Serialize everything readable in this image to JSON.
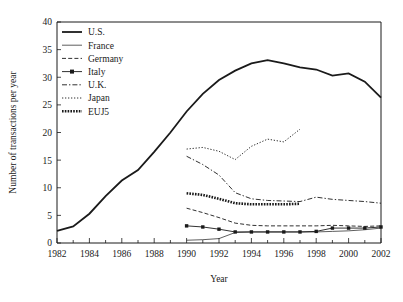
{
  "chart_data": {
    "type": "line",
    "title": "",
    "xlabel": "Year",
    "ylabel": "Number of transactions per year",
    "xlim": [
      1982,
      2002
    ],
    "ylim": [
      0,
      40
    ],
    "xticks": [
      1982,
      1984,
      1986,
      1988,
      1990,
      1992,
      1994,
      1996,
      1998,
      2000,
      2002
    ],
    "xtick_labels": [
      "1982",
      "1984",
      "1986",
      "1988",
      "1990",
      "1992",
      "1994",
      "1996",
      "1998",
      "2000",
      "2002"
    ],
    "xminor_ticks": [
      1983,
      1985,
      1987,
      1989,
      1991,
      1993,
      1995,
      1997,
      1999,
      2001
    ],
    "yticks": [
      0,
      5,
      10,
      15,
      20,
      25,
      30,
      35,
      40
    ],
    "ytick_labels": [
      "0",
      "5",
      "10",
      "15",
      "20",
      "25",
      "30",
      "35",
      "40"
    ],
    "grid": false,
    "legend_position": "top-left",
    "series": [
      {
        "name": "U.S.",
        "style": "solid-thick",
        "markers": "none",
        "x": [
          1982,
          1983,
          1984,
          1985,
          1986,
          1987,
          1988,
          1989,
          1990,
          1991,
          1992,
          1993,
          1994,
          1995,
          1996,
          1997,
          1998,
          1999,
          2000,
          2001,
          2002
        ],
        "values": [
          2.2,
          3.0,
          5.3,
          8.5,
          11.3,
          13.2,
          16.5,
          20.0,
          23.8,
          27.0,
          29.5,
          31.2,
          32.5,
          33.1,
          32.5,
          31.8,
          31.4,
          30.3,
          30.7,
          29.2,
          26.3
        ]
      },
      {
        "name": "France",
        "style": "solid-thin",
        "markers": "none",
        "x": [
          1990,
          1991,
          1992,
          1993,
          1994,
          1995,
          1996,
          1997,
          1998,
          1999,
          2000,
          2001,
          2002
        ],
        "values": [
          0.5,
          0.6,
          0.8,
          1.9,
          2.0,
          2.0,
          2.0,
          2.0,
          2.0,
          2.1,
          2.2,
          2.4,
          2.7
        ]
      },
      {
        "name": "Germany",
        "style": "dashed",
        "markers": "none",
        "x": [
          1990,
          1991,
          1992,
          1993,
          1994,
          1995,
          1996,
          1997,
          1998,
          1999,
          2000,
          2001,
          2002
        ],
        "values": [
          6.3,
          5.5,
          4.6,
          3.6,
          3.2,
          3.1,
          3.1,
          3.1,
          3.1,
          3.2,
          3.1,
          3.0,
          3.1
        ]
      },
      {
        "name": "Italy",
        "style": "solid-marker",
        "markers": "square",
        "x": [
          1990,
          1991,
          1992,
          1993,
          1994,
          1995,
          1996,
          1997,
          1998,
          1999,
          2000,
          2001,
          2002
        ],
        "values": [
          3.1,
          2.9,
          2.5,
          2.0,
          2.0,
          2.0,
          2.0,
          2.0,
          2.1,
          2.7,
          2.7,
          2.7,
          2.9
        ]
      },
      {
        "name": "U.K.",
        "style": "dash-dot",
        "markers": "none",
        "x": [
          1990,
          1991,
          1992,
          1993,
          1994,
          1995,
          1996,
          1997,
          1998,
          1999,
          2000,
          2001,
          2002
        ],
        "values": [
          15.7,
          14.2,
          12.3,
          9.1,
          8.0,
          7.7,
          7.6,
          7.5,
          8.3,
          7.9,
          7.7,
          7.5,
          7.2
        ]
      },
      {
        "name": "Japan",
        "style": "dotted",
        "markers": "none",
        "x": [
          1990,
          1991,
          1992,
          1993,
          1994,
          1995,
          1996,
          1997
        ],
        "values": [
          17.0,
          17.3,
          16.6,
          15.1,
          17.5,
          18.8,
          18.3,
          20.6
        ]
      },
      {
        "name": "EUJ5",
        "style": "beaded",
        "markers": "none",
        "x": [
          1990,
          1991,
          1992,
          1993,
          1994,
          1995,
          1996,
          1997
        ],
        "values": [
          9.0,
          8.7,
          8.0,
          7.2,
          7.0,
          7.0,
          7.0,
          7.1
        ]
      }
    ]
  },
  "legend": {
    "items": [
      {
        "label": "U.S."
      },
      {
        "label": "France"
      },
      {
        "label": "Germany"
      },
      {
        "label": "Italy"
      },
      {
        "label": "U.K."
      },
      {
        "label": "Japan"
      },
      {
        "label": "EUJ5"
      }
    ]
  },
  "colors": {
    "ink": "#1a1a1a",
    "background": "#ffffff"
  }
}
